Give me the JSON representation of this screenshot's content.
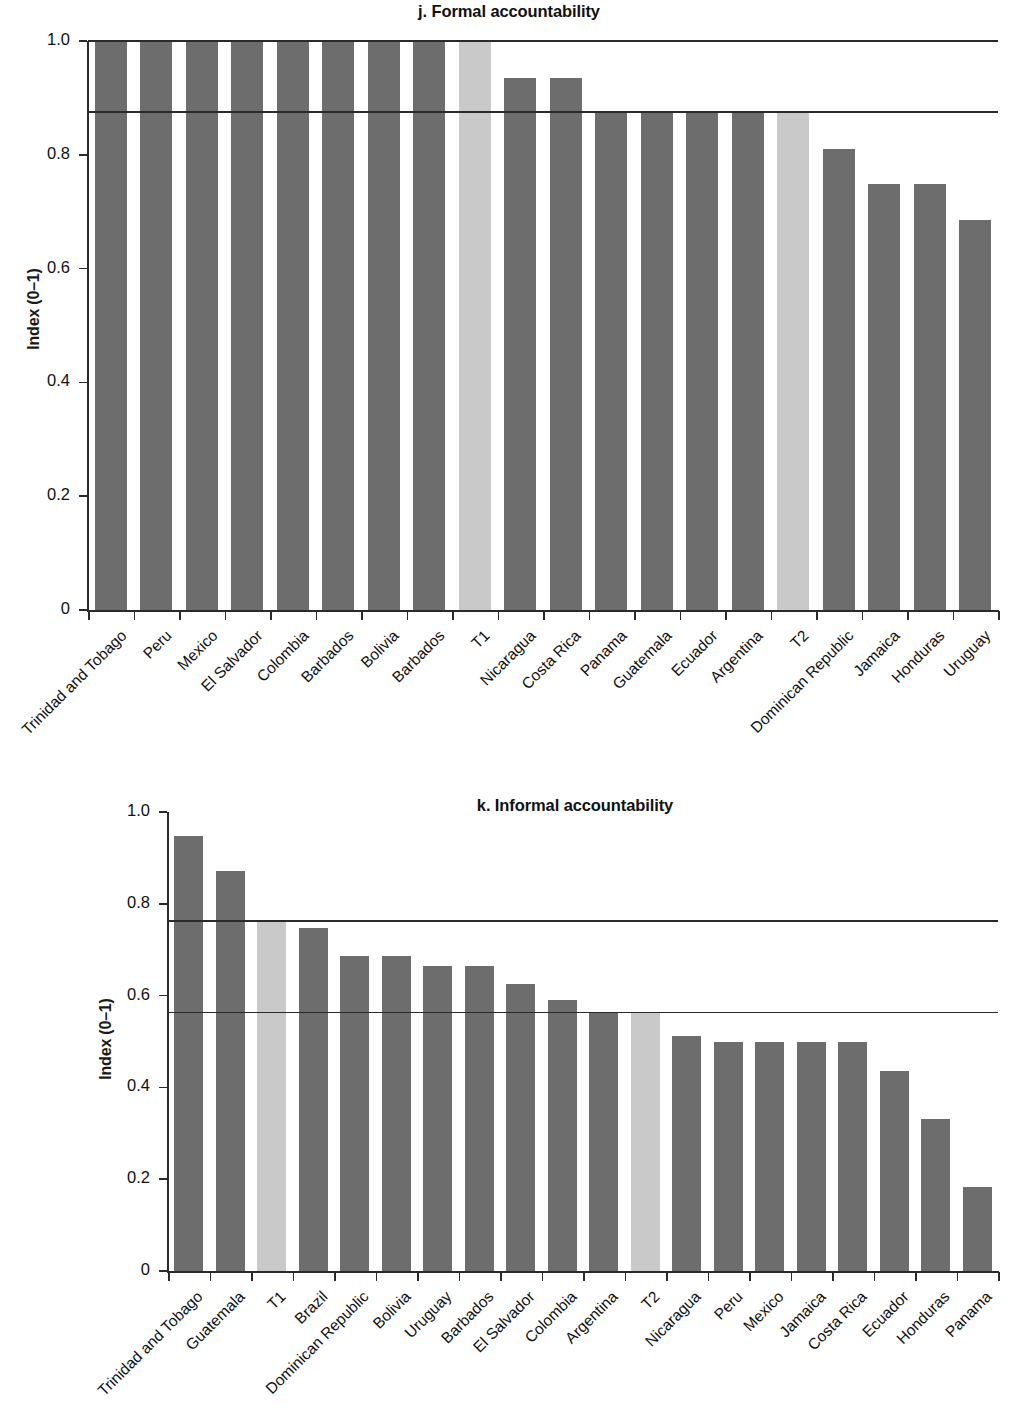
{
  "figure": {
    "ylabel": "Index (0–1)",
    "bar_color_dark": "#6d6d6d",
    "bar_color_light": "#c9c9c9",
    "axis_color": "#2a2a2a"
  },
  "chart_data": [
    {
      "type": "bar",
      "title": "j. Formal accountability",
      "xlabel": "",
      "ylabel": "Index (0–1)",
      "ylim": [
        0,
        1.0
      ],
      "yticks": [
        0,
        0.2,
        0.4,
        0.6,
        0.8,
        1.0
      ],
      "ytick_labels": [
        "0",
        "0.2",
        "0.4",
        "0.6",
        "0.8",
        "1.0"
      ],
      "grid": false,
      "legend": "none",
      "categories": [
        "Trinidad and Tobago",
        "Peru",
        "Mexico",
        "El Salvador",
        "Colombia",
        "Barbados",
        "Bolivia",
        "Barbados",
        "T1",
        "Nicaragua",
        "Costa Rica",
        "Panama",
        "Guatemala",
        "Ecuador",
        "Argentina",
        "T2",
        "Dominican Republic",
        "Jamaica",
        "Honduras",
        "Uruguay"
      ],
      "values": [
        1.0,
        1.0,
        1.0,
        1.0,
        1.0,
        1.0,
        1.0,
        1.0,
        1.0,
        0.935,
        0.935,
        0.875,
        0.875,
        0.875,
        0.875,
        0.875,
        0.81,
        0.748,
        0.748,
        0.685
      ],
      "highlighted": [
        "T1",
        "T2"
      ],
      "reference_lines": [
        1.0,
        0.875
      ]
    },
    {
      "type": "bar",
      "title": "k. Informal accountability",
      "xlabel": "",
      "ylabel": "Index (0–1)",
      "ylim": [
        0,
        1.0
      ],
      "yticks": [
        0,
        0.2,
        0.4,
        0.6,
        0.8,
        1.0
      ],
      "ytick_labels": [
        "0",
        "0.2",
        "0.4",
        "0.6",
        "0.8",
        "1.0"
      ],
      "grid": false,
      "legend": "none",
      "categories": [
        "Trinidad and Tobago",
        "Guatemala",
        "T1",
        "Brazil",
        "Dominican Republic",
        "Bolivia",
        "Uruguay",
        "Barbados",
        "El Salvador",
        "Colombia",
        "Argentina",
        "T2",
        "Nicaragua",
        "Peru",
        "Mexico",
        "Jamaica",
        "Costa Rica",
        "Ecuador",
        "Honduras",
        "Panama"
      ],
      "values": [
        0.948,
        0.871,
        0.762,
        0.748,
        0.687,
        0.687,
        0.664,
        0.664,
        0.625,
        0.591,
        0.563,
        0.563,
        0.512,
        0.5,
        0.5,
        0.5,
        0.5,
        0.436,
        0.331,
        0.183
      ],
      "highlighted": [
        "T1",
        "T2"
      ],
      "reference_lines": [
        0.762,
        0.563
      ]
    }
  ]
}
